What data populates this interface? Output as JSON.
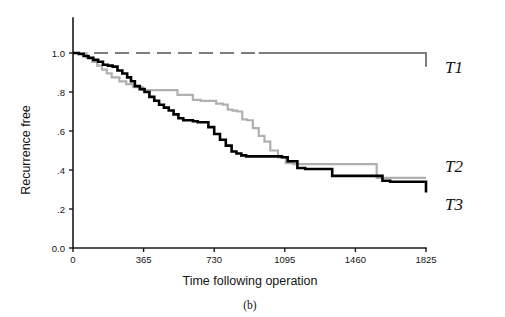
{
  "figure": {
    "caption": "(b)",
    "background_color": "#ffffff"
  },
  "chart_data": {
    "type": "line",
    "title": "",
    "subtitle": "",
    "xlabel": "Time following operation",
    "ylabel": "Recurrence free",
    "xlim": [
      0,
      1825
    ],
    "ylim": [
      0.0,
      1.0
    ],
    "grid": false,
    "legend_position": "right",
    "x_ticks": [
      0,
      365,
      730,
      1095,
      1460,
      1825
    ],
    "x_tick_labels": [
      "0",
      "365",
      "730",
      "1095",
      "1460",
      "1825"
    ],
    "y_ticks": [
      0.0,
      0.2,
      0.4,
      0.6,
      0.8,
      1.0
    ],
    "y_tick_labels": [
      "0.0",
      ".2",
      ".4",
      ".6",
      ".8",
      "1.0"
    ],
    "annotations": [
      "T1",
      "T2",
      "T3"
    ],
    "series": [
      {
        "name": "T1",
        "label": "T1",
        "color": "#7d7d7d",
        "stroke_width": 2.0,
        "dash": "14 7",
        "dash_until_x": 960,
        "step": "post",
        "x": [
          0,
          60,
          960,
          1825
        ],
        "values": [
          1.0,
          1.0,
          1.0,
          0.93
        ]
      },
      {
        "name": "T2",
        "label": "T2",
        "color": "#b0b0b0",
        "stroke_width": 2.2,
        "dash": "none",
        "step": "post",
        "x": [
          0,
          40,
          70,
          100,
          125,
          150,
          175,
          200,
          240,
          275,
          310,
          360,
          400,
          450,
          500,
          540,
          580,
          620,
          660,
          700,
          740,
          775,
          800,
          825,
          850,
          875,
          900,
          930,
          960,
          990,
          1020,
          1060,
          1100,
          1140,
          1530,
          1570,
          1825
        ],
        "values": [
          1.0,
          1.0,
          0.975,
          0.955,
          0.935,
          0.915,
          0.895,
          0.875,
          0.855,
          0.84,
          0.825,
          0.81,
          0.81,
          0.81,
          0.81,
          0.785,
          0.785,
          0.76,
          0.755,
          0.755,
          0.74,
          0.735,
          0.71,
          0.705,
          0.7,
          0.66,
          0.655,
          0.615,
          0.575,
          0.545,
          0.5,
          0.465,
          0.435,
          0.43,
          0.43,
          0.36,
          0.36
        ]
      },
      {
        "name": "T3",
        "label": "T3",
        "color": "#000000",
        "stroke_width": 2.6,
        "dash": "none",
        "step": "post",
        "x": [
          0,
          30,
          55,
          80,
          105,
          130,
          155,
          180,
          205,
          230,
          255,
          280,
          300,
          320,
          345,
          370,
          395,
          420,
          445,
          470,
          495,
          520,
          545,
          570,
          595,
          620,
          645,
          670,
          700,
          730,
          760,
          790,
          820,
          845,
          870,
          895,
          1080,
          1110,
          1160,
          1200,
          1300,
          1340,
          1600,
          1640,
          1825
        ],
        "values": [
          1.0,
          0.995,
          0.985,
          0.975,
          0.965,
          0.955,
          0.94,
          0.935,
          0.93,
          0.91,
          0.895,
          0.875,
          0.855,
          0.83,
          0.815,
          0.8,
          0.775,
          0.755,
          0.735,
          0.72,
          0.705,
          0.685,
          0.665,
          0.655,
          0.655,
          0.65,
          0.645,
          0.645,
          0.62,
          0.585,
          0.555,
          0.525,
          0.495,
          0.485,
          0.475,
          0.47,
          0.465,
          0.445,
          0.41,
          0.405,
          0.405,
          0.37,
          0.345,
          0.34,
          0.285
        ]
      }
    ]
  },
  "axes": {
    "axis_color": "#1a1a1a",
    "tick_color": "#1a1a1a"
  }
}
